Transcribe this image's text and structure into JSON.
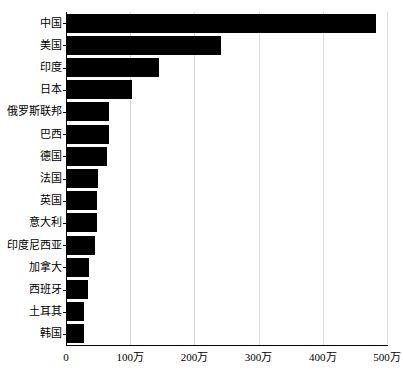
{
  "chart_data": {
    "type": "bar",
    "orientation": "horizontal",
    "title": "",
    "xlabel": "",
    "ylabel": "",
    "unit": "万",
    "categories": [
      "中国",
      "美国",
      "印度",
      "日本",
      "俄罗斯联邦",
      "巴西",
      "德国",
      "法国",
      "英国",
      "意大利",
      "印度尼西亚",
      "加拿大",
      "西班牙",
      "土耳其",
      "韩国"
    ],
    "values": [
      482,
      240,
      144,
      102,
      66,
      65,
      62,
      48,
      47,
      46,
      44,
      34,
      33,
      27,
      26
    ],
    "xlim": [
      0,
      500
    ],
    "x_ticks": [
      0,
      100,
      200,
      300,
      400,
      500
    ],
    "x_tick_labels": [
      "0",
      "100万",
      "200万",
      "300万",
      "400万",
      "500万"
    ],
    "grid": "vertical gridlines at each x tick",
    "legend": "none",
    "colors": {
      "bar": "#000000",
      "grid": "#d9d9d9",
      "axis": "#000000",
      "text": "#000000",
      "background": "#ffffff"
    }
  }
}
